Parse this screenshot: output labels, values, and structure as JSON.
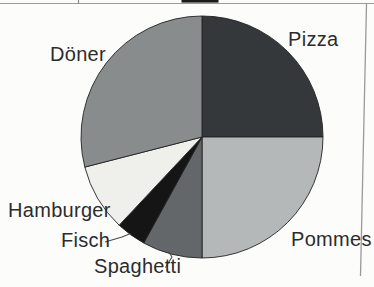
{
  "chart_data": {
    "type": "pie",
    "title": "",
    "categories": [
      "Pizza",
      "Pommes",
      "Spaghetti",
      "Fisch",
      "Hamburger",
      "Döner"
    ],
    "values": [
      25,
      25,
      8,
      4,
      9,
      29
    ],
    "values_unit": "percent (estimated from slice angles; no numeric labels printed on chart)",
    "colors": [
      "#35383a",
      "#b5b8b8",
      "#63676a",
      "#151515",
      "#efefeb",
      "#888c8d"
    ],
    "outline_color": "#232323",
    "start_angle_deg": 0,
    "direction": "clockwise",
    "legend": "none - direct category labels around pie, leader lines for small slices",
    "geometry": {
      "cx": 202,
      "cy": 137,
      "r": 121
    },
    "leader_lines": [
      {
        "label": "Fisch",
        "points": [
          [
            105,
            242
          ],
          [
            122,
            237
          ],
          [
            130.5,
            233.5
          ]
        ]
      },
      {
        "label": "Spaghetti",
        "points": [
          [
            165.5,
            267.5
          ],
          [
            172,
            257
          ],
          [
            168.5,
            251.5
          ]
        ]
      }
    ]
  }
}
